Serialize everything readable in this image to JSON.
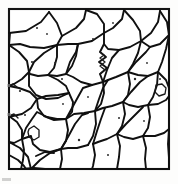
{
  "figure": {
    "kind": "line-drawing",
    "background_color": "#fdfdfc",
    "interior_color": "#ffffff",
    "line_color": "#101010",
    "dot_color": "#2a2a2a",
    "width_px": 178,
    "height_px": 184
  },
  "frame": {
    "name": "outer-border",
    "x": 9,
    "y": 9,
    "width": 160,
    "height": 160,
    "stroke_width": 2.1,
    "color": "#151515"
  },
  "chart_data": {
    "type": "diagram",
    "xlabel": "",
    "ylabel": "",
    "grain_count": 44,
    "inclusion_count": 18,
    "boundary_segments": [
      "M 9 33 L 26 31 L 41 22 L 49 12",
      "M 49 12 L 57 23 L 62 36 L 57 45",
      "M 57 45 L 44 48 L 30 47 L 20 44 L 9 45",
      "M 9 45 L 10 33",
      "M 62 36 L 76 28 L 84 19 L 86 10",
      "M 86 10 L 97 14 L 104 24 L 104 33",
      "M 104 33 L 92 41 L 78 44 L 68 44 L 57 45",
      "M 104 33 L 113 28 L 122 19 L 124 10",
      "M 124 10 L 133 20 L 140 31 L 141 41",
      "M 141 41 L 130 47 L 119 50 L 108 49 L 104 44 L 104 33",
      "M 141 41 L 151 33 L 158 22 L 160 11",
      "M 160 11 L 167 22 L 169 35",
      "M 169 35 L 160 44 L 150 47 L 141 41",
      "M 9 45 L 19 52 L 27 61 L 29 72",
      "M 29 72 L 22 79 L 14 84 L 9 86",
      "M 9 86 L 9 60 L 9 45",
      "M 57 45 L 57 57 L 54 68 L 48 75",
      "M 48 75 L 38 76 L 30 74 L 29 72",
      "M 29 72 L 34 62 L 44 53 L 57 45",
      "M 48 75 L 58 80 L 66 86 L 69 93",
      "M 69 93 L 58 98 L 46 99 L 36 95 L 29 86 L 29 72",
      "M 78 44 L 76 56 L 72 66 L 66 74",
      "M 66 74 L 57 76 L 48 75",
      "M 104 44 L 100 52 L 106 57 L 99 62 L 107 68 L 100 74 L 103 82",
      "M 103 82 L 92 85 L 81 82 L 73 77 L 66 74",
      "M 66 74 L 70 62 L 76 52 L 78 44",
      "M 141 41 L 138 53 L 133 64 L 128 72",
      "M 128 72 L 116 77 L 108 80 L 103 82",
      "M 103 82 L 107 70 L 112 58 L 119 50",
      "M 169 35 L 166 49 L 162 62 L 158 72",
      "M 158 72 L 148 76 L 138 75 L 128 72",
      "M 128 72 L 136 62 L 146 52 L 150 47",
      "M 158 72 L 166 80 L 169 88",
      "M 169 88 L 169 62 L 169 35",
      "M 9 86 L 19 88 L 30 92 L 37 99",
      "M 37 99 L 31 108 L 22 114 L 13 116 L 9 116",
      "M 9 116 L 9 101 L 9 86",
      "M 69 93 L 73 102 L 72 112 L 66 119",
      "M 66 119 L 54 120 L 44 116 L 38 108 L 37 99",
      "M 37 99 L 46 96 L 58 95 L 69 93",
      "M 103 82 L 104 93 L 101 104 L 95 111",
      "M 95 111 L 84 113 L 74 114 L 66 119",
      "M 66 119 L 72 108 L 78 97 L 83 88 L 92 85",
      "M 128 72 L 130 84 L 128 95 L 123 102",
      "M 123 102 L 112 106 L 103 108 L 95 111",
      "M 95 111 L 99 99 L 103 88 L 108 80",
      "M 158 72 L 157 85 L 153 97 L 148 105",
      "M 148 105 L 138 107 L 129 105 L 123 102",
      "M 123 102 L 131 92 L 140 82 L 148 76",
      "M 148 105 L 158 104 L 166 100 L 169 96",
      "M 169 96 L 169 88",
      "M 9 116 L 17 122 L 22 130 L 22 139",
      "M 22 139 L 14 143 L 9 142",
      "M 9 142 L 9 129 L 9 116",
      "M 66 119 L 68 130 L 66 141 L 61 149",
      "M 61 149 L 50 152 L 40 150 L 33 144 L 31 136 L 22 139",
      "M 22 139 L 26 128 L 32 119 L 37 112 L 47 117 L 57 119 L 66 119",
      "M 95 111 L 96 124 L 93 136 L 88 145",
      "M 88 145 L 77 148 L 68 148 L 61 149",
      "M 61 149 L 68 137 L 75 124 L 82 115 L 88 113",
      "M 123 102 L 125 114 L 122 126 L 117 134",
      "M 117 134 L 107 139 L 98 142 L 93 144",
      "M 93 144 L 97 131 L 101 119 L 105 108",
      "M 148 105 L 150 117 L 148 128 L 143 136",
      "M 143 136 L 133 139 L 124 137 L 117 134",
      "M 117 134 L 126 124 L 136 114 L 143 107",
      "M 143 136 L 155 136 L 164 133 L 169 129",
      "M 169 129 L 169 112 L 169 96",
      "M 22 139 L 24 150 L 23 160 L 21 169",
      "M 61 149 L 62 159 L 60 169",
      "M 93 144 L 95 155 L 93 166 L 92 169",
      "M 117 134 L 120 146 L 119 157 L 117 169",
      "M 143 136 L 146 148 L 145 159 L 146 169",
      "M 169 129 L 168 144 L 169 158 L 169 169",
      "M 9 142 L 9 155 L 9 169",
      "M 21 169 L 9 169",
      "M 21 169 L 34 168 L 45 169 L 60 169",
      "M 60 169 L 76 169 L 92 169",
      "M 92 169 L 104 169 L 117 169",
      "M 117 169 L 131 169 L 146 169",
      "M 146 169 L 158 169 L 169 169",
      "M 9 142 L 20 148 L 28 157 L 31 169",
      "M 31 169 L 40 160 L 50 153 L 61 149",
      "M 36 156 L 45 152 L 54 153",
      "M 9 155 L 18 160 L 24 166 L 26 169"
    ],
    "thin_segments": [
      "M 29 129 L 34 126 L 39 130 L 39 137 L 34 140 L 29 137 L 28 132 Z",
      "M 156 85 L 162 84 L 166 88 L 165 94 L 159 96 L 155 92 Z",
      "M 100 52 L 104 55 L 100 58 L 105 62 L 100 66 L 105 70 L 100 74",
      "M 9 116 L 14 114 L 18 118",
      "M 9 86 L 13 84 L 17 87"
    ],
    "inclusions": [
      {
        "cx": 32,
        "cy": 62,
        "r": 1.1
      },
      {
        "cx": 37,
        "cy": 28,
        "r": 1.0
      },
      {
        "cx": 93,
        "cy": 39,
        "r": 1.0
      },
      {
        "cx": 113,
        "cy": 23,
        "r": 0.9
      },
      {
        "cx": 55,
        "cy": 63,
        "r": 1.0
      },
      {
        "cx": 62,
        "cy": 79,
        "r": 1.0
      },
      {
        "cx": 20,
        "cy": 91,
        "r": 1.1
      },
      {
        "cx": 25,
        "cy": 115,
        "r": 1.0
      },
      {
        "cx": 135,
        "cy": 79,
        "r": 1.2
      },
      {
        "cx": 160,
        "cy": 79,
        "r": 1.0
      },
      {
        "cx": 147,
        "cy": 63,
        "r": 0.9
      },
      {
        "cx": 79,
        "cy": 140,
        "r": 1.2
      },
      {
        "cx": 108,
        "cy": 155,
        "r": 1.0
      },
      {
        "cx": 63,
        "cy": 104,
        "r": 0.9
      },
      {
        "cx": 119,
        "cy": 118,
        "r": 1.0
      },
      {
        "cx": 144,
        "cy": 121,
        "r": 0.9
      },
      {
        "cx": 47,
        "cy": 34,
        "r": 0.9
      },
      {
        "cx": 88,
        "cy": 97,
        "r": 0.9
      }
    ],
    "edge_marks": [
      {
        "x": 7,
        "y": 113,
        "w": 4,
        "h": 3
      },
      {
        "x": 7,
        "y": 84,
        "w": 3,
        "h": 3
      }
    ],
    "caption_fragments": [
      {
        "x": 2,
        "y": 178,
        "w": 9,
        "h": 3
      }
    ]
  }
}
